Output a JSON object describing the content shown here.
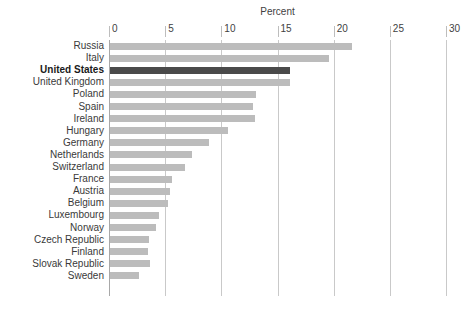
{
  "chart_data": {
    "type": "bar",
    "orientation": "horizontal",
    "title": "Percent",
    "xlabel": "Percent",
    "ylabel": "",
    "xlim": [
      0,
      30
    ],
    "xticks": [
      0,
      5,
      10,
      15,
      20,
      25,
      30
    ],
    "xtick_labels": [
      "0",
      "5",
      "10",
      "15",
      "20",
      "25",
      "30"
    ],
    "grid": "vertical",
    "legend": "none",
    "highlight_category": "United States",
    "bar_color": "#bcbcbc",
    "highlight_color": "#4a4a4a",
    "categories": [
      "Russia",
      "Italy",
      "United States",
      "United Kingdom",
      "Poland",
      "Spain",
      "Ireland",
      "Hungary",
      "Germany",
      "Netherlands",
      "Switzerland",
      "France",
      "Austria",
      "Belgium",
      "Luxembourg",
      "Norway",
      "Czech Republic",
      "Finland",
      "Slovak Republic",
      "Sweden"
    ],
    "values": [
      21.5,
      19.5,
      16.0,
      16.0,
      13.0,
      12.7,
      12.9,
      10.5,
      8.8,
      7.3,
      6.7,
      5.5,
      5.3,
      5.2,
      4.4,
      4.1,
      3.5,
      3.4,
      3.6,
      2.6
    ]
  }
}
